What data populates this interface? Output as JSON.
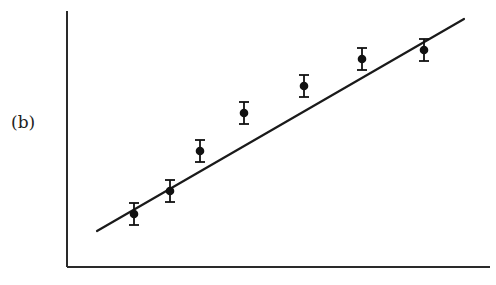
{
  "panel_label": "(b)",
  "colors": {
    "axis": "#2a2a2a",
    "line": "#1a1a1a",
    "marker": "#111111",
    "background": "#ffffff"
  },
  "chart_data": {
    "type": "scatter",
    "title": "",
    "panel": "(b)",
    "xlabel": "",
    "ylabel": "",
    "grid": false,
    "legend": null,
    "ticks": "none",
    "series": [
      {
        "name": "measurements",
        "kind": "points_with_error_bars",
        "x": [
          134,
          170,
          200,
          244,
          304,
          362,
          424
        ],
        "y": [
          214,
          191,
          151,
          113,
          86,
          59,
          50
        ],
        "error": [
          11,
          11,
          11,
          11,
          11,
          11,
          11
        ],
        "note": "pixel coordinates (no axis scale shown)"
      },
      {
        "name": "linear fit",
        "kind": "line",
        "x": [
          97,
          464
        ],
        "y": [
          231,
          19
        ]
      }
    ],
    "axes": {
      "origin": [
        67,
        267
      ],
      "y_top": 11,
      "x_right": 490
    }
  }
}
